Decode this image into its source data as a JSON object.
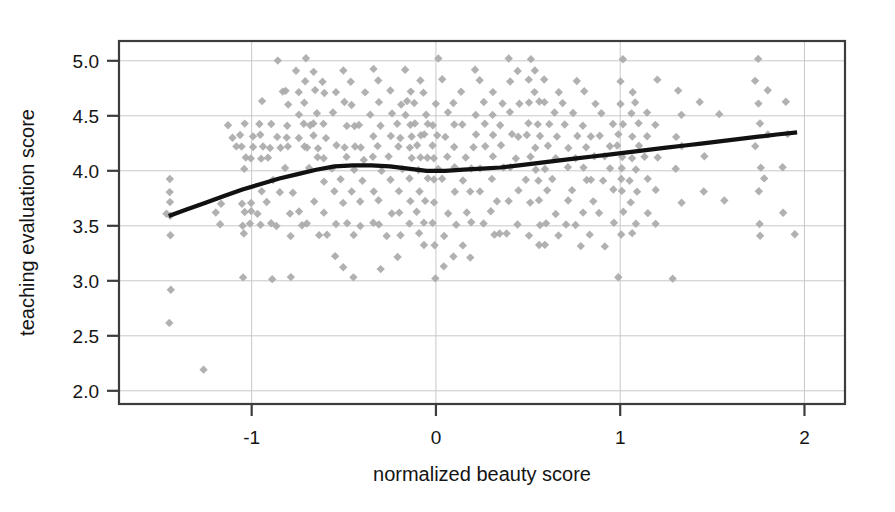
{
  "figure": {
    "background_color": "#ffffff",
    "frame_color": "#3c3c3c",
    "grid_color": "#c8c8c8",
    "point_color": "#aaaaaa",
    "curve_color": "#111111"
  },
  "axes": {
    "x_title": "normalized beauty score",
    "y_title": "teaching evaluation score",
    "x_ticks": [
      "-1",
      "0",
      "1",
      "2"
    ],
    "y_ticks": [
      "2.0",
      "2.5",
      "3.0",
      "3.5",
      "4.0",
      "4.5",
      "5.0"
    ]
  },
  "chart_data": {
    "type": "scatter",
    "title": "",
    "xlabel": "normalized beauty score",
    "ylabel": "teaching evaluation score",
    "xlim": [
      -1.72,
      2.22
    ],
    "ylim": [
      1.88,
      5.18
    ],
    "xticks": [
      -1,
      0,
      1,
      2
    ],
    "xtick_labels": [
      "-1",
      "0",
      "1",
      "2"
    ],
    "yticks": [
      2.0,
      2.5,
      3.0,
      3.5,
      4.0,
      4.5,
      5.0
    ],
    "ytick_labels": [
      "2.0",
      "2.5",
      "3.0",
      "3.5",
      "4.0",
      "4.5",
      "5.0"
    ],
    "grid": true,
    "grid_axis": "both",
    "legend": null,
    "marker": "diamond",
    "marker_color": "#aaaaaa",
    "marker_size": 7,
    "series": [
      {
        "name": "instructor observations",
        "type": "scatter",
        "x": [
          -1.45,
          -1.45,
          -1.45,
          -1.45,
          -1.45,
          -1.45,
          -1.45,
          -1.45,
          -1.25,
          -1.18,
          -1.18,
          -1.18,
          -1.12,
          -1.12,
          -1.08,
          -1.05,
          -1.05,
          -1.05,
          -1.05,
          -1.05,
          -1.05,
          -1.05,
          -1.05,
          -1.05,
          -1.05,
          -1.0,
          -1.0,
          -1.0,
          -1.0,
          -1.0,
          -1.0,
          -0.95,
          -0.95,
          -0.95,
          -0.95,
          -0.95,
          -0.95,
          -0.95,
          -0.95,
          -0.9,
          -0.9,
          -0.9,
          -0.9,
          -0.9,
          -0.9,
          -0.9,
          -0.85,
          -0.85,
          -0.85,
          -0.85,
          -0.85,
          -0.85,
          -0.8,
          -0.8,
          -0.8,
          -0.8,
          -0.8,
          -0.8,
          -0.8,
          -0.8,
          -0.78,
          -0.78,
          -0.75,
          -0.75,
          -0.75,
          -0.75,
          -0.75,
          -0.72,
          -0.72,
          -0.72,
          -0.7,
          -0.7,
          -0.7,
          -0.7,
          -0.7,
          -0.7,
          -0.7,
          -0.65,
          -0.65,
          -0.65,
          -0.65,
          -0.65,
          -0.65,
          -0.65,
          -0.65,
          -0.65,
          -0.6,
          -0.6,
          -0.6,
          -0.6,
          -0.6,
          -0.6,
          -0.6,
          -0.6,
          -0.55,
          -0.55,
          -0.55,
          -0.55,
          -0.55,
          -0.55,
          -0.55,
          -0.5,
          -0.5,
          -0.5,
          -0.5,
          -0.5,
          -0.5,
          -0.5,
          -0.5,
          -0.5,
          -0.45,
          -0.45,
          -0.45,
          -0.45,
          -0.45,
          -0.45,
          -0.45,
          -0.45,
          -0.4,
          -0.4,
          -0.4,
          -0.4,
          -0.4,
          -0.4,
          -0.4,
          -0.35,
          -0.35,
          -0.35,
          -0.35,
          -0.35,
          -0.35,
          -0.3,
          -0.3,
          -0.3,
          -0.3,
          -0.3,
          -0.3,
          -0.3,
          -0.3,
          -0.25,
          -0.25,
          -0.25,
          -0.25,
          -0.25,
          -0.25,
          -0.25,
          -0.2,
          -0.2,
          -0.2,
          -0.2,
          -0.2,
          -0.2,
          -0.2,
          -0.2,
          -0.2,
          -0.15,
          -0.15,
          -0.15,
          -0.15,
          -0.15,
          -0.15,
          -0.15,
          -0.15,
          -0.15,
          -0.15,
          -0.15,
          -0.1,
          -0.1,
          -0.1,
          -0.1,
          -0.1,
          -0.1,
          -0.1,
          -0.1,
          -0.1,
          -0.1,
          -0.05,
          -0.05,
          -0.05,
          -0.05,
          -0.05,
          -0.05,
          -0.05,
          -0.05,
          -0.05,
          0.0,
          0.0,
          0.0,
          0.0,
          0.0,
          0.0,
          0.0,
          0.0,
          0.0,
          0.0,
          0.0,
          0.0,
          0.05,
          0.05,
          0.05,
          0.05,
          0.05,
          0.05,
          0.05,
          0.05,
          0.1,
          0.1,
          0.1,
          0.1,
          0.1,
          0.1,
          0.1,
          0.15,
          0.15,
          0.15,
          0.15,
          0.15,
          0.15,
          0.2,
          0.2,
          0.2,
          0.2,
          0.2,
          0.2,
          0.2,
          0.2,
          0.25,
          0.25,
          0.25,
          0.25,
          0.25,
          0.25,
          0.25,
          0.3,
          0.3,
          0.3,
          0.3,
          0.3,
          0.3,
          0.3,
          0.35,
          0.35,
          0.35,
          0.35,
          0.35,
          0.35,
          0.4,
          0.4,
          0.4,
          0.4,
          0.4,
          0.4,
          0.4,
          0.45,
          0.45,
          0.45,
          0.45,
          0.45,
          0.45,
          0.5,
          0.5,
          0.5,
          0.5,
          0.5,
          0.5,
          0.5,
          0.5,
          0.5,
          0.55,
          0.55,
          0.55,
          0.55,
          0.55,
          0.55,
          0.55,
          0.55,
          0.55,
          0.55,
          0.55,
          0.6,
          0.6,
          0.6,
          0.6,
          0.6,
          0.6,
          0.6,
          0.6,
          0.65,
          0.65,
          0.65,
          0.65,
          0.65,
          0.65,
          0.65,
          0.7,
          0.7,
          0.7,
          0.7,
          0.7,
          0.7,
          0.75,
          0.75,
          0.75,
          0.75,
          0.75,
          0.75,
          0.8,
          0.8,
          0.8,
          0.8,
          0.8,
          0.8,
          0.8,
          0.85,
          0.85,
          0.85,
          0.85,
          0.85,
          0.85,
          0.9,
          0.9,
          0.9,
          0.9,
          0.9,
          0.9,
          0.95,
          0.95,
          0.95,
          0.95,
          0.95,
          1.0,
          1.0,
          1.0,
          1.0,
          1.0,
          1.0,
          1.0,
          1.0,
          1.0,
          1.0,
          1.0,
          1.0,
          1.0,
          1.05,
          1.05,
          1.05,
          1.05,
          1.05,
          1.05,
          1.05,
          1.1,
          1.1,
          1.1,
          1.1,
          1.1,
          1.1,
          1.15,
          1.15,
          1.15,
          1.15,
          1.15,
          1.2,
          1.2,
          1.2,
          1.2,
          1.2,
          1.3,
          1.3,
          1.3,
          1.3,
          1.35,
          1.35,
          1.35,
          1.45,
          1.45,
          1.45,
          1.55,
          1.55,
          1.75,
          1.75,
          1.75,
          1.75,
          1.75,
          1.75,
          1.75,
          1.75,
          1.75,
          1.8,
          1.8,
          1.8,
          1.9,
          1.9,
          1.9,
          1.9,
          1.95
        ],
        "y": [
          3.92,
          3.82,
          3.72,
          3.62,
          3.6,
          3.41,
          2.91,
          2.61,
          2.2,
          3.71,
          3.62,
          3.51,
          4.41,
          4.31,
          4.22,
          4.42,
          4.32,
          4.22,
          4.12,
          4.01,
          3.71,
          3.62,
          3.51,
          3.42,
          3.02,
          4.31,
          4.21,
          4.11,
          3.72,
          3.62,
          3.51,
          4.62,
          4.42,
          4.32,
          4.22,
          4.12,
          3.82,
          3.61,
          3.51,
          4.42,
          4.22,
          4.12,
          3.92,
          3.72,
          3.52,
          3.02,
          5.01,
          4.72,
          4.31,
          4.22,
          3.81,
          3.51,
          4.72,
          4.61,
          4.42,
          4.31,
          4.22,
          4.02,
          3.62,
          3.42,
          3.81,
          3.02,
          4.91,
          4.72,
          4.51,
          4.31,
          3.62,
          4.42,
          4.22,
          3.51,
          5.02,
          4.81,
          4.62,
          4.42,
          4.22,
          4.02,
          3.52,
          4.91,
          4.72,
          4.52,
          4.42,
          4.31,
          4.21,
          4.12,
          3.72,
          3.41,
          4.82,
          4.72,
          4.42,
          4.31,
          4.12,
          3.91,
          3.62,
          3.42,
          4.72,
          4.52,
          4.22,
          4.02,
          3.81,
          3.52,
          3.22,
          4.91,
          4.62,
          4.42,
          4.21,
          4.12,
          3.92,
          3.72,
          3.51,
          3.12,
          4.82,
          4.61,
          4.42,
          4.22,
          4.02,
          3.82,
          3.42,
          3.02,
          4.72,
          4.42,
          4.22,
          4.11,
          3.92,
          3.71,
          3.51,
          4.92,
          4.52,
          4.32,
          4.12,
          3.82,
          3.52,
          4.81,
          4.62,
          4.41,
          4.22,
          4.01,
          3.72,
          3.52,
          3.11,
          4.72,
          4.52,
          4.32,
          4.12,
          3.92,
          3.61,
          3.42,
          4.61,
          4.42,
          4.31,
          4.22,
          4.02,
          3.82,
          3.62,
          3.42,
          3.21,
          4.91,
          4.72,
          4.62,
          4.52,
          4.42,
          4.32,
          4.22,
          4.12,
          3.92,
          3.72,
          3.52,
          4.82,
          4.62,
          4.42,
          4.32,
          4.22,
          4.12,
          4.02,
          3.82,
          3.62,
          3.42,
          4.72,
          4.52,
          4.42,
          4.32,
          4.12,
          3.92,
          3.72,
          3.52,
          3.32,
          5.01,
          4.62,
          4.42,
          4.32,
          4.22,
          4.12,
          4.02,
          3.92,
          3.72,
          3.52,
          3.32,
          3.02,
          4.82,
          4.52,
          4.32,
          4.12,
          3.92,
          3.62,
          3.42,
          3.12,
          4.62,
          4.42,
          4.22,
          4.02,
          3.82,
          3.52,
          3.22,
          4.72,
          4.42,
          4.12,
          3.92,
          3.62,
          3.32,
          4.92,
          4.52,
          4.32,
          4.22,
          4.02,
          3.82,
          3.52,
          3.22,
          4.81,
          4.62,
          4.42,
          4.22,
          4.02,
          3.81,
          3.52,
          4.72,
          4.52,
          4.32,
          4.12,
          3.92,
          3.62,
          3.42,
          4.62,
          4.42,
          4.22,
          4.02,
          3.72,
          3.42,
          5.02,
          4.82,
          4.52,
          4.32,
          4.02,
          3.72,
          3.42,
          4.92,
          4.62,
          4.32,
          4.12,
          3.82,
          3.52,
          5.01,
          4.82,
          4.62,
          4.42,
          4.32,
          4.12,
          3.92,
          3.72,
          3.42,
          4.92,
          4.72,
          4.62,
          4.42,
          4.32,
          4.22,
          4.02,
          3.92,
          3.72,
          3.52,
          3.32,
          4.82,
          4.62,
          4.42,
          4.22,
          4.02,
          3.82,
          3.52,
          3.32,
          4.72,
          4.52,
          4.32,
          4.12,
          3.92,
          3.62,
          3.42,
          4.62,
          4.42,
          4.22,
          4.02,
          3.72,
          3.52,
          4.82,
          4.52,
          4.32,
          4.12,
          3.82,
          3.52,
          4.72,
          4.42,
          4.22,
          4.02,
          3.92,
          3.62,
          3.32,
          4.62,
          4.32,
          4.12,
          3.92,
          3.72,
          3.42,
          4.52,
          4.32,
          4.12,
          3.92,
          3.62,
          3.32,
          4.42,
          4.22,
          4.02,
          3.82,
          3.52,
          5.02,
          4.82,
          4.62,
          4.42,
          4.32,
          4.22,
          4.12,
          4.02,
          3.92,
          3.82,
          3.62,
          3.42,
          3.02,
          4.72,
          4.52,
          4.32,
          4.12,
          3.92,
          3.72,
          3.42,
          4.62,
          4.42,
          4.22,
          4.02,
          3.82,
          3.52,
          4.52,
          4.32,
          4.12,
          3.92,
          3.62,
          4.82,
          4.42,
          4.12,
          3.82,
          3.52,
          4.72,
          4.32,
          4.02,
          3.02,
          4.52,
          4.22,
          3.72,
          4.62,
          4.12,
          3.82,
          4.52,
          3.72,
          5.02,
          4.82,
          4.62,
          4.42,
          4.22,
          4.02,
          3.82,
          3.52,
          3.42,
          4.72,
          4.32,
          3.92,
          4.62,
          4.32,
          4.02,
          3.62,
          3.43
        ]
      },
      {
        "name": "loess smoother",
        "type": "line",
        "color": "#111111",
        "x": [
          -1.45,
          -1.35,
          -1.25,
          -1.15,
          -1.05,
          -0.95,
          -0.85,
          -0.75,
          -0.65,
          -0.55,
          -0.45,
          -0.35,
          -0.25,
          -0.15,
          -0.05,
          0.05,
          0.15,
          0.25,
          0.35,
          0.45,
          0.55,
          0.65,
          0.75,
          0.85,
          0.95,
          1.05,
          1.15,
          1.25,
          1.35,
          1.45,
          1.55,
          1.65,
          1.75,
          1.85,
          1.96
        ],
        "y": [
          3.59,
          3.65,
          3.71,
          3.77,
          3.83,
          3.88,
          3.93,
          3.97,
          4.01,
          4.04,
          4.05,
          4.05,
          4.04,
          4.02,
          4.0,
          4.0,
          4.01,
          4.02,
          4.03,
          4.05,
          4.07,
          4.09,
          4.11,
          4.13,
          4.15,
          4.17,
          4.19,
          4.21,
          4.23,
          4.25,
          4.27,
          4.29,
          4.31,
          4.33,
          4.35
        ]
      }
    ]
  }
}
